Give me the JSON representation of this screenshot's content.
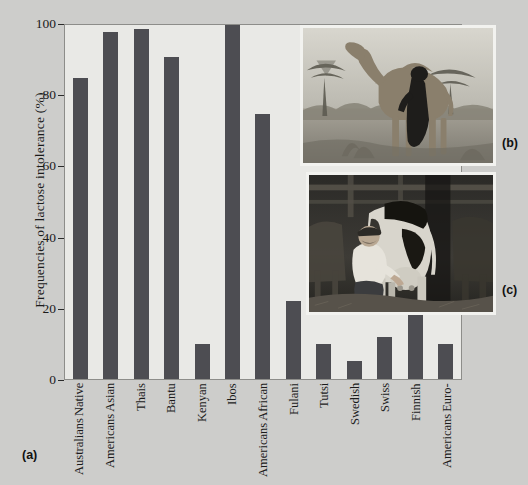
{
  "figure": {
    "background_color": "#cdcdcb",
    "plot_background_color": "#e9e9e6",
    "bar_color": "#4d4d52",
    "panel_labels": {
      "a": "(a)",
      "b": "(b)",
      "c": "(c)"
    }
  },
  "chart_data": {
    "type": "bar",
    "title": "",
    "xlabel": "",
    "ylabel": "Frequencies of lactose intolerance (%)",
    "ylim": [
      0,
      100
    ],
    "yticks": [
      0,
      20,
      40,
      60,
      80,
      100
    ],
    "grid": false,
    "legend": "none",
    "categories": [
      "Native Australians",
      "Asian Americans",
      "Thais",
      "Bantu",
      "Kenyan",
      "Ibos",
      "African Americans",
      "Fulani",
      "Tutsi",
      "Swedish",
      "Swiss",
      "Finnish",
      "Euro-Americans"
    ],
    "category_lines": [
      [
        "Native",
        "Australians"
      ],
      [
        "Asian",
        "Americans"
      ],
      [
        "Thais"
      ],
      [
        "Bantu"
      ],
      [
        "Kenyan"
      ],
      [
        "Ibos"
      ],
      [
        "African",
        "Americans"
      ],
      [
        "Fulani"
      ],
      [
        "Tutsi"
      ],
      [
        "Swedish"
      ],
      [
        "Swiss"
      ],
      [
        "Finnish"
      ],
      [
        "Euro-",
        "Americans"
      ]
    ],
    "values": [
      85,
      98,
      99,
      91,
      10,
      100,
      75,
      22,
      10,
      5,
      12,
      18,
      10
    ]
  },
  "photos": {
    "b": {
      "caption": "(b)",
      "description": "Black-and-white photograph of a dromedary camel being milked by a person in an arid acacia savanna"
    },
    "c": {
      "caption": "(c)",
      "description": "Black-and-white photograph of a man crouching to hand-milk a Holstein dairy cow inside a barn"
    }
  }
}
